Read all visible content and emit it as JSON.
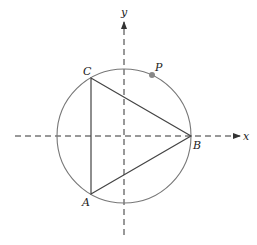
{
  "diagram": {
    "type": "geometry",
    "colors": {
      "axes": "#333333",
      "circle": "#777777",
      "triangle": "#444444",
      "point_p": "#888888"
    },
    "axes": {
      "x_label": "x",
      "y_label": "y"
    },
    "circle": {
      "center": [
        124,
        136
      ],
      "radius": 67
    },
    "vertices": {
      "A": {
        "label": "A",
        "pos": [
          91,
          194
        ]
      },
      "B": {
        "label": "B",
        "pos": [
          191,
          136
        ]
      },
      "C": {
        "label": "C",
        "pos": [
          91,
          78
        ]
      }
    },
    "point_p": {
      "label": "P",
      "pos": [
        152,
        75
      ]
    }
  }
}
